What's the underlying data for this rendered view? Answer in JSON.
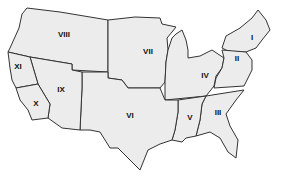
{
  "map": {
    "title": "United States regions",
    "fill_color": "#ececec",
    "border_color": "#333333",
    "label_color": "#111111",
    "regions": [
      {
        "id": "I",
        "label": "I",
        "x": 252,
        "y": 38
      },
      {
        "id": "II",
        "label": "II",
        "x": 237,
        "y": 59
      },
      {
        "id": "III",
        "label": "III",
        "x": 218,
        "y": 113
      },
      {
        "id": "IV",
        "label": "IV",
        "x": 205,
        "y": 76
      },
      {
        "id": "V",
        "label": "V",
        "x": 190,
        "y": 118
      },
      {
        "id": "VI",
        "label": "VI",
        "x": 130,
        "y": 116
      },
      {
        "id": "VII",
        "label": "VII",
        "x": 148,
        "y": 52
      },
      {
        "id": "VIII",
        "label": "VIII",
        "x": 64,
        "y": 35
      },
      {
        "id": "IX",
        "label": "IX",
        "x": 61,
        "y": 90
      },
      {
        "id": "X",
        "label": "X",
        "x": 36,
        "y": 104
      },
      {
        "id": "XI",
        "label": "XI",
        "x": 18,
        "y": 67
      }
    ]
  }
}
